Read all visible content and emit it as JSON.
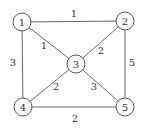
{
  "graph": {
    "type": "weighted-undirected",
    "nodes": [
      {
        "id": "1",
        "label": "1",
        "x": 22,
        "y": 22
      },
      {
        "id": "2",
        "label": "2",
        "x": 125,
        "y": 21
      },
      {
        "id": "3",
        "label": "3",
        "x": 76,
        "y": 64
      },
      {
        "id": "4",
        "label": "4",
        "x": 23,
        "y": 107
      },
      {
        "id": "5",
        "label": "5",
        "x": 125,
        "y": 107
      }
    ],
    "edges": [
      {
        "from": "1",
        "to": "2",
        "weight": "1",
        "lx": 74,
        "ly": 13
      },
      {
        "from": "1",
        "to": "3",
        "weight": "1",
        "lx": 44,
        "ly": 45
      },
      {
        "from": "2",
        "to": "3",
        "weight": "2",
        "lx": 101,
        "ly": 50
      },
      {
        "from": "1",
        "to": "4",
        "weight": "3",
        "lx": 13,
        "ly": 62
      },
      {
        "from": "2",
        "to": "5",
        "weight": "5",
        "lx": 132,
        "ly": 62
      },
      {
        "from": "3",
        "to": "4",
        "weight": "2",
        "lx": 56,
        "ly": 86
      },
      {
        "from": "3",
        "to": "5",
        "weight": "3",
        "lx": 94,
        "ly": 86
      },
      {
        "from": "4",
        "to": "5",
        "weight": "2",
        "lx": 75,
        "ly": 118
      }
    ]
  },
  "style": {
    "node_radius": 9,
    "edge_color": "#6a6a6a",
    "node_stroke": "#5a5a5a",
    "text_color": "#333333"
  }
}
